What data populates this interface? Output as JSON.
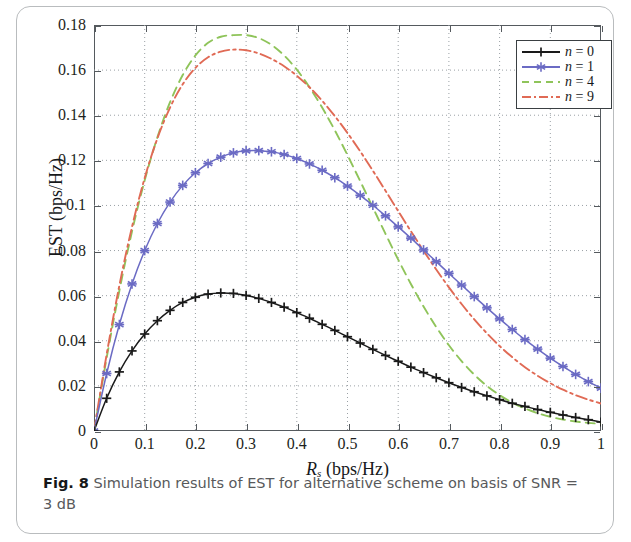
{
  "figure": {
    "caption_label": "Fig. 8",
    "caption_text": " Simulation results of EST for alternative scheme on basis of SNR = 3 dB"
  },
  "axes": {
    "xlabel_main": "R",
    "xlabel_sub": "s",
    "xlabel_unit": " (bps/Hz)",
    "ylabel": "EST (bps/Hz)",
    "xticks": [
      "0",
      "0.1",
      "0.2",
      "0.3",
      "0.4",
      "0.5",
      "0.6",
      "0.7",
      "0.8",
      "0.9",
      "1"
    ],
    "yticks": [
      "0",
      "0.02",
      "0.04",
      "0.06",
      "0.08",
      "0.1",
      "0.12",
      "0.14",
      "0.16",
      "0.18"
    ]
  },
  "legend": {
    "items": [
      {
        "label": "n = 0",
        "color": "#1a1a1a",
        "style": "solid-plus"
      },
      {
        "label": "n = 1",
        "color": "#6b6bc4",
        "style": "solid-star"
      },
      {
        "label": "n = 4",
        "color": "#8fc45a",
        "style": "dashed"
      },
      {
        "label": "n = 9",
        "color": "#e06a55",
        "style": "dashdot"
      }
    ]
  },
  "chart_data": {
    "type": "line",
    "title": "Simulation results of EST for alternative scheme on basis of SNR = 3 dB",
    "xlabel": "R_s (bps/Hz)",
    "ylabel": "EST (bps/Hz)",
    "xlim": [
      0,
      1
    ],
    "ylim": [
      0,
      0.18
    ],
    "xticks": [
      0,
      0.1,
      0.2,
      0.3,
      0.4,
      0.5,
      0.6,
      0.7,
      0.8,
      0.9,
      1
    ],
    "yticks": [
      0,
      0.02,
      0.04,
      0.06,
      0.08,
      0.1,
      0.12,
      0.14,
      0.16,
      0.18
    ],
    "grid": true,
    "legend_position": "top-right",
    "x": [
      0,
      0.025,
      0.05,
      0.075,
      0.1,
      0.125,
      0.15,
      0.175,
      0.2,
      0.225,
      0.25,
      0.275,
      0.3,
      0.325,
      0.35,
      0.375,
      0.4,
      0.425,
      0.45,
      0.475,
      0.5,
      0.525,
      0.55,
      0.575,
      0.6,
      0.625,
      0.65,
      0.675,
      0.7,
      0.725,
      0.75,
      0.775,
      0.8,
      0.825,
      0.85,
      0.875,
      0.9,
      0.925,
      0.95,
      0.975,
      1
    ],
    "series": [
      {
        "name": "n = 0",
        "color": "#1a1a1a",
        "marker": "plus",
        "linestyle": "solid",
        "peak": {
          "x": 0.23,
          "y": 0.0612
        },
        "values": [
          0,
          0.0145,
          0.0262,
          0.0355,
          0.043,
          0.0489,
          0.0535,
          0.057,
          0.0593,
          0.0607,
          0.0612,
          0.061,
          0.0601,
          0.0588,
          0.057,
          0.0549,
          0.0525,
          0.05,
          0.0473,
          0.0446,
          0.0418,
          0.039,
          0.0362,
          0.0335,
          0.0309,
          0.0283,
          0.0259,
          0.0236,
          0.0214,
          0.0193,
          0.0174,
          0.0156,
          0.0139,
          0.0123,
          0.0109,
          0.0095,
          0.0083,
          0.0071,
          0.006,
          0.005,
          0.004
        ]
      },
      {
        "name": "n = 1",
        "color": "#6b6bc4",
        "marker": "star",
        "linestyle": "solid",
        "peak": {
          "x": 0.28,
          "y": 0.1243
        },
        "values": [
          0,
          0.0255,
          0.0472,
          0.0652,
          0.08,
          0.092,
          0.1015,
          0.1089,
          0.1145,
          0.1186,
          0.1214,
          0.1233,
          0.1242,
          0.1243,
          0.1238,
          0.1226,
          0.1208,
          0.1184,
          0.1156,
          0.1123,
          0.1086,
          0.1045,
          0.1001,
          0.0954,
          0.0905,
          0.0855,
          0.0803,
          0.0751,
          0.0699,
          0.0647,
          0.0596,
          0.0546,
          0.0497,
          0.045,
          0.0405,
          0.0363,
          0.0323,
          0.0286,
          0.0251,
          0.0219,
          0.019
        ]
      },
      {
        "name": "n = 4",
        "color": "#8fc45a",
        "marker": "none",
        "linestyle": "dashed",
        "peak": {
          "x": 0.3,
          "y": 0.1755
        },
        "values": [
          0,
          0.0325,
          0.0622,
          0.0885,
          0.1112,
          0.1302,
          0.1458,
          0.1578,
          0.1665,
          0.1721,
          0.1748,
          0.1755,
          0.1755,
          0.1742,
          0.1712,
          0.1665,
          0.1602,
          0.1524,
          0.1434,
          0.1333,
          0.1223,
          0.1108,
          0.0991,
          0.0874,
          0.076,
          0.0652,
          0.0552,
          0.0461,
          0.038,
          0.031,
          0.025,
          0.02,
          0.0159,
          0.0126,
          0.01,
          0.0079,
          0.0063,
          0.0051,
          0.0042,
          0.0036,
          0.0032
        ]
      },
      {
        "name": "n = 9",
        "color": "#e06a55",
        "marker": "none",
        "linestyle": "dashdot",
        "peak": {
          "x": 0.28,
          "y": 0.1692
        },
        "values": [
          0,
          0.034,
          0.0645,
          0.0905,
          0.1122,
          0.1297,
          0.1434,
          0.1537,
          0.161,
          0.1657,
          0.1682,
          0.1691,
          0.1688,
          0.1674,
          0.165,
          0.1617,
          0.1575,
          0.1524,
          0.1464,
          0.1396,
          0.1321,
          0.124,
          0.1154,
          0.1065,
          0.0975,
          0.0886,
          0.0799,
          0.0716,
          0.0637,
          0.0563,
          0.0495,
          0.0433,
          0.0377,
          0.0327,
          0.0283,
          0.0245,
          0.0212,
          0.0183,
          0.0159,
          0.0139,
          0.0122
        ]
      }
    ]
  }
}
